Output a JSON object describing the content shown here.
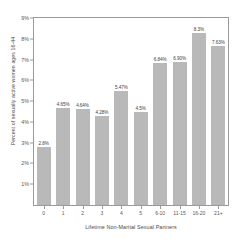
{
  "chart_data": {
    "type": "bar",
    "title": "",
    "xlabel": "Lifetime Non-Marital Sexual Partners",
    "ylabel": "Percent of sexually active women ages 16-44",
    "categories": [
      "0",
      "1",
      "2",
      "3",
      "4",
      "5",
      "6-10",
      "11-15",
      "16-20",
      "21+"
    ],
    "values": [
      2.8,
      4.65,
      4.64,
      4.28,
      5.47,
      4.5,
      6.84,
      6.9,
      8.3,
      7.63
    ],
    "data_labels": [
      "2.8%",
      "4.65%",
      "4.64%",
      "4.28%",
      "4.5%",
      "5.47%",
      "6.84%",
      "6.90%",
      "8.3%",
      "7.63%"
    ],
    "bar_labels": [
      "2.8%",
      "4.65%",
      "4.64%",
      "4.28%",
      "5.47%",
      "4.5%",
      "6.84%",
      "6.90%",
      "8.3%",
      "7.63%"
    ],
    "ytick_labels": [
      "1%",
      "2%",
      "3%",
      "4%",
      "5%",
      "6%",
      "7%",
      "8%",
      "9%"
    ],
    "ytick_values": [
      1,
      2,
      3,
      4,
      5,
      6,
      7,
      8,
      9
    ],
    "ylim": [
      0,
      9
    ],
    "xlim_categories": 10,
    "grid": false,
    "legend": false,
    "bar_color": "#b9b9b9",
    "frame_color": "#9a9a9a",
    "text_color": "#4a4a4a"
  }
}
